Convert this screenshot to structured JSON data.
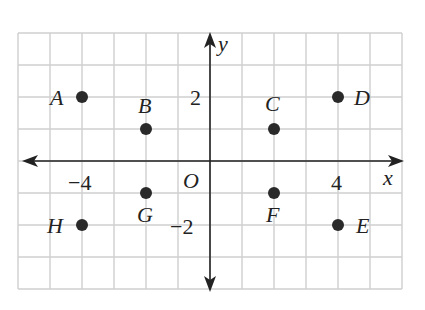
{
  "diagram": {
    "type": "coordinate_plane",
    "axes": {
      "x_label": "x",
      "y_label": "y",
      "origin_label": "O",
      "x_range": [
        -6,
        6
      ],
      "y_range": [
        -4,
        4
      ],
      "grid_step": 1,
      "tick_labels": {
        "x_neg": "−4",
        "x_pos": "4",
        "y_pos": "2",
        "y_neg": "−2"
      }
    },
    "points": [
      {
        "label": "A",
        "x": -4,
        "y": 2
      },
      {
        "label": "B",
        "x": -2,
        "y": 1
      },
      {
        "label": "C",
        "x": 2,
        "y": 1
      },
      {
        "label": "D",
        "x": 4,
        "y": 2
      },
      {
        "label": "E",
        "x": 4,
        "y": -2
      },
      {
        "label": "F",
        "x": 2,
        "y": -1
      },
      {
        "label": "G",
        "x": -2,
        "y": -1
      },
      {
        "label": "H",
        "x": -4,
        "y": -2
      }
    ],
    "colors": {
      "grid": "#cfcfcf",
      "axis": "#222222",
      "point": "#2a2a2a"
    }
  }
}
